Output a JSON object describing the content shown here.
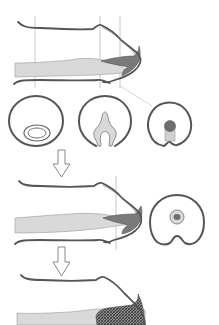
{
  "figure": {
    "title_residue": "",
    "colors": {
      "outline": "#555555",
      "light_fill": "#d9d9d9",
      "dark_fill": "#7a7a7a",
      "hatch_fill": "#5e5e5e",
      "guide_line": "#bbbbbb",
      "arrow": "#888888",
      "background": "#ffffff"
    },
    "stages": [
      {
        "name": "stage-1-long-section",
        "cross_sections": [
          "oval-lumen",
          "folding-plate",
          "solid-core"
        ],
        "guide_lines": 3
      },
      {
        "name": "stage-2-long-section",
        "cross_sections": [
          "ring-with-core"
        ],
        "guide_lines": 1
      },
      {
        "name": "stage-3-long-section",
        "cross_sections": [],
        "guide_lines": 0
      }
    ],
    "arrows": [
      {
        "name": "arrow-stage-1-to-2",
        "direction": "down"
      },
      {
        "name": "arrow-stage-2-to-3",
        "direction": "down"
      }
    ]
  }
}
